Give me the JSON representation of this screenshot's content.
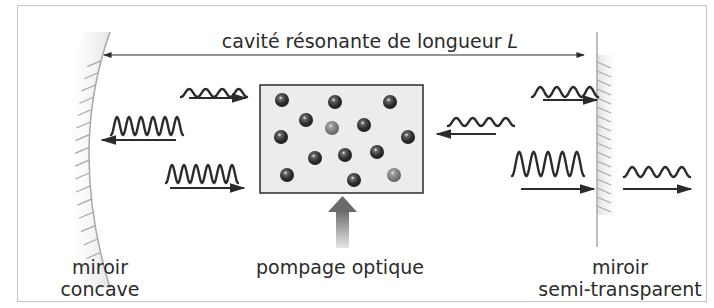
{
  "title": "cavité résonante de longueur",
  "title_var": "L",
  "labels": {
    "left_mirror": [
      "miroir",
      "concave"
    ],
    "pump": "pompage optique",
    "right_mirror": [
      "miroir",
      "semi-transparent"
    ]
  },
  "colors": {
    "frame": "#b8b8b8",
    "ink": "#2b2b2b",
    "medium_fill": "#ececec",
    "atom_dark": "#2e2e2e",
    "atom_excited": "#7a7a7a",
    "pump_arrow": "#6e6e6e"
  },
  "atoms": {
    "dark": [
      [
        282,
        100
      ],
      [
        335,
        102
      ],
      [
        390,
        102
      ],
      [
        306,
        120
      ],
      [
        364,
        125
      ],
      [
        281,
        137
      ],
      [
        408,
        137
      ],
      [
        315,
        158
      ],
      [
        345,
        155
      ],
      [
        377,
        152
      ],
      [
        287,
        175
      ],
      [
        354,
        180
      ]
    ],
    "excited": [
      [
        332,
        128
      ],
      [
        394,
        175
      ]
    ]
  },
  "waves": [
    {
      "id": "top-left-weak",
      "x": 181,
      "y": 89,
      "w": 66,
      "amp": 4,
      "cycles": 4,
      "arrow": "right",
      "ax1": 189,
      "ax2": 246,
      "ay": 98
    },
    {
      "id": "mid-left-strong",
      "x": 111,
      "y": 117,
      "w": 72,
      "amp": 9,
      "cycles": 6,
      "arrow": "left",
      "ax1": 102,
      "ax2": 176,
      "ay": 140
    },
    {
      "id": "bottom-left-strong",
      "x": 166,
      "y": 165,
      "w": 72,
      "amp": 9,
      "cycles": 6,
      "arrow": "right",
      "ax1": 170,
      "ax2": 244,
      "ay": 188
    },
    {
      "id": "mid-right-weak",
      "x": 448,
      "y": 118,
      "w": 66,
      "amp": 4,
      "cycles": 4,
      "arrow": "left",
      "ax1": 437,
      "ax2": 496,
      "ay": 134
    },
    {
      "id": "top-right-weak",
      "x": 532,
      "y": 87,
      "w": 66,
      "amp": 5,
      "cycles": 4,
      "arrow": "right",
      "ax1": 543,
      "ax2": 597,
      "ay": 100
    },
    {
      "id": "bottom-right-strong",
      "x": 512,
      "y": 152,
      "w": 72,
      "amp": 12,
      "cycles": 5,
      "arrow": "right",
      "ax1": 521,
      "ax2": 594,
      "ay": 189
    },
    {
      "id": "output-weak",
      "x": 624,
      "y": 167,
      "w": 66,
      "amp": 5,
      "cycles": 4,
      "arrow": "right",
      "ax1": 623,
      "ax2": 691,
      "ay": 189
    }
  ]
}
